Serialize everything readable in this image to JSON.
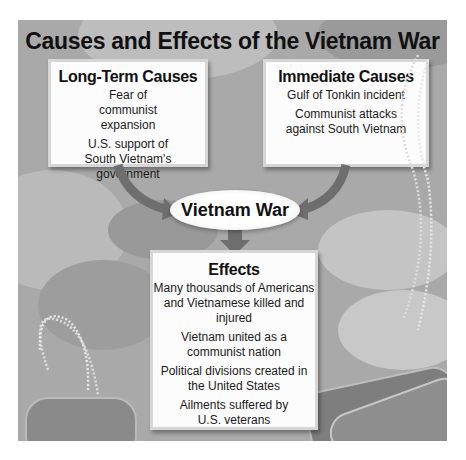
{
  "title": "Causes and Effects of the Vietnam War",
  "long_term": {
    "heading": "Long-Term Causes",
    "items": [
      "Fear of communist expansion",
      "U.S. support of South Vietnam's government"
    ]
  },
  "immediate": {
    "heading": "Immediate Causes",
    "items": [
      "Gulf of Tonkin incident",
      "Communist attacks against South Vietnam"
    ]
  },
  "center": {
    "label": "Vietnam War"
  },
  "effects": {
    "heading": "Effects",
    "items": [
      "Many thousands of Americans and Vietnamese killed and injured",
      "Vietnam united as a communist nation",
      "Political divisions created in the United States",
      "Ailments suffered by U.S. veterans"
    ]
  },
  "decorations": {
    "background": "camouflage-pattern",
    "images": [
      "dog-tags-left",
      "dog-tags-right"
    ]
  },
  "colors": {
    "panel": "#a9a9a9",
    "box": "#fcfcfc",
    "arrow": "#6e6e6e"
  }
}
